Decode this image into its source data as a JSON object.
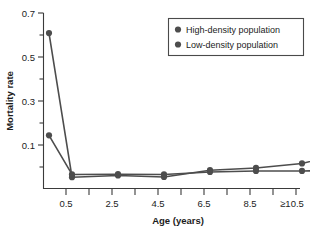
{
  "chart_data": {
    "type": "line",
    "title": "",
    "xlabel": "Age (years)",
    "ylabel": "Mortality rate",
    "grid": false,
    "legend_position": "top-right",
    "categories": [
      "0.5",
      "1.5",
      "2.5",
      "3.5",
      "4.5",
      "5.5",
      "6.5",
      "7.5",
      "8.5",
      "9.5",
      "≥10.5"
    ],
    "x_tick_labels": [
      "0.5",
      "",
      "2.5",
      "",
      "4.5",
      "",
      "6.5",
      "",
      "8.5",
      "",
      "≥10.5"
    ],
    "x_visible_tick_labels": [
      "0.5",
      "2.5",
      "4.5",
      "6.5",
      "8.5",
      "≥10.5"
    ],
    "y_tick_labels": [
      "0.1",
      "0.3",
      "0.5",
      "0.7"
    ],
    "y_tick_values": [
      0.1,
      0.3,
      0.5,
      0.7
    ],
    "y_minor_tick_values": [
      0.2,
      0.4,
      0.6
    ],
    "ylim": [
      0.0,
      0.7
    ],
    "series": [
      {
        "name": "High-density population",
        "color": "#4d4d4d",
        "marker": "circle",
        "x": [
          0.0,
          0.5,
          1.5,
          2.5,
          3.5,
          4.5,
          5.5,
          6.5,
          7.5,
          8.5,
          9.5,
          10.5
        ],
        "values": [
          0.62,
          0.045,
          0.052,
          0.046,
          0.073,
          0.082,
          0.1,
          0.145,
          0.148,
          0.151,
          0.172,
          0.197
        ]
      },
      {
        "name": "Low-density population",
        "color": "#4d4d4d",
        "marker": "circle",
        "x": [
          0.0,
          0.5,
          1.5,
          2.5,
          3.5,
          4.5,
          5.5,
          6.5,
          7.5,
          8.5,
          9.5,
          10.5
        ],
        "values": [
          0.212,
          0.056,
          0.057,
          0.056,
          0.066,
          0.07,
          0.07,
          0.072,
          0.076,
          0.077,
          0.08,
          0.085
        ]
      }
    ],
    "legend": [
      {
        "label": "High-density population",
        "color": "#4d4d4d"
      },
      {
        "label": "Low-density population",
        "color": "#4d4d4d"
      }
    ]
  }
}
